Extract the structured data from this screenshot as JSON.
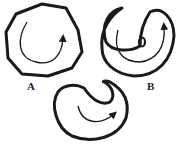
{
  "diagram": {
    "labels": {
      "a": "A",
      "b": "B"
    },
    "shapes": [
      {
        "id": "shape-a",
        "label": "A",
        "description": "closed rounded polygon with inner curved arrow"
      },
      {
        "id": "shape-b",
        "label": "B",
        "description": "folded U-shaped outline with inner arrow and small oval"
      },
      {
        "id": "shape-c",
        "label": "",
        "description": "rounded shape with notch at top-right and inner curved arrow"
      }
    ],
    "colors": {
      "stroke": "#1a1a1a",
      "background": "#ffffff"
    }
  }
}
